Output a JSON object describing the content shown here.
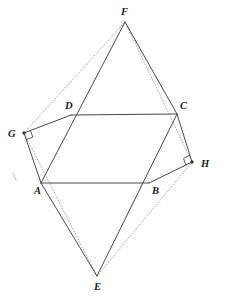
{
  "figure": {
    "canvas": {
      "width": 226,
      "height": 299,
      "background": "#ffffff"
    },
    "colors": {
      "solid_stroke": "#4a4a4a",
      "dotted_stroke": "#8f8f8f",
      "label_color": "#1c1c1c",
      "vertex_dot": "#3a3a3a"
    },
    "points": {
      "A": {
        "x": 41,
        "y": 183,
        "label": "A",
        "label_x": 34,
        "label_y": 194
      },
      "B": {
        "x": 149,
        "y": 183,
        "label": "B",
        "label_x": 152,
        "label_y": 194
      },
      "C": {
        "x": 177,
        "y": 114,
        "label": "C",
        "label_x": 180,
        "label_y": 109
      },
      "D": {
        "x": 71,
        "y": 115,
        "label": "D",
        "label_x": 65,
        "label_y": 109
      },
      "E": {
        "x": 97,
        "y": 276,
        "label": "E",
        "label_x": 94,
        "label_y": 290
      },
      "F": {
        "x": 125,
        "y": 22,
        "label": "F",
        "label_x": 121,
        "label_y": 15
      },
      "G": {
        "x": 24,
        "y": 133,
        "label": "G",
        "label_x": 8,
        "label_y": 137
      },
      "H": {
        "x": 192,
        "y": 162,
        "label": "H",
        "label_x": 201,
        "label_y": 167
      }
    },
    "solid_edges": [
      {
        "name": "edge-D-C",
        "from": "D",
        "to": "C"
      },
      {
        "name": "edge-A-B",
        "from": "A",
        "to": "B"
      },
      {
        "name": "edge-G-D",
        "from": "G",
        "to": "D"
      },
      {
        "name": "edge-G-A",
        "from": "G",
        "to": "A"
      },
      {
        "name": "edge-C-H",
        "from": "C",
        "to": "H"
      },
      {
        "name": "edge-B-H",
        "from": "B",
        "to": "H"
      },
      {
        "name": "edge-F-D-A",
        "from": "F",
        "to": "A"
      },
      {
        "name": "edge-F-C-B",
        "from": "F",
        "to": "C"
      },
      {
        "name": "edge-C-B-E",
        "from": "C",
        "to": "E"
      },
      {
        "name": "edge-A-E",
        "from": "A",
        "to": "E"
      }
    ],
    "dotted_edges": [
      {
        "name": "dotted-G-F",
        "from": "G",
        "to": "F"
      },
      {
        "name": "dotted-G-E",
        "from": "G",
        "to": "E"
      },
      {
        "name": "dotted-F-H",
        "from": "F",
        "to": "H"
      },
      {
        "name": "dotted-E-H",
        "from": "E",
        "to": "H"
      }
    ],
    "right_angles": [
      {
        "name": "right-angle-marker-g",
        "at": "G"
      },
      {
        "name": "right-angle-marker-h",
        "at": "H"
      }
    ],
    "labels_order": [
      "F",
      "D",
      "C",
      "G",
      "H",
      "A",
      "B",
      "E"
    ]
  }
}
